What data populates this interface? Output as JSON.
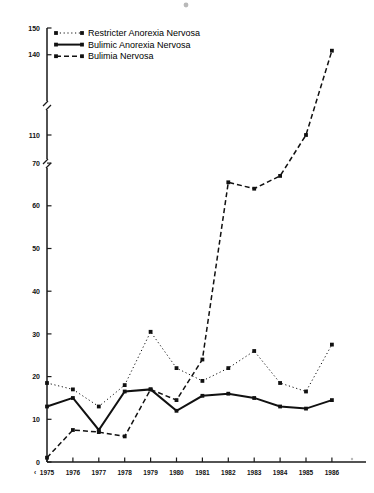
{
  "chart_data": {
    "type": "line",
    "title": "",
    "subtitle": "",
    "xlabel": "",
    "ylabel": "",
    "x": [
      1975,
      1976,
      1977,
      1978,
      1979,
      1980,
      1981,
      1982,
      1983,
      1984,
      1985,
      1986
    ],
    "categories": [
      "1975",
      "1976",
      "1977",
      "1978",
      "1979",
      "1980",
      "1981",
      "1982",
      "1983",
      "1984",
      "1985",
      "1986"
    ],
    "x_prefix_marker": "‹",
    "grid": false,
    "legend_position": "top-left",
    "ylim": [
      0,
      150
    ],
    "y_axis_broken": true,
    "y_tick_labels": [
      "0",
      "10",
      "20",
      "30",
      "40",
      "50",
      "60",
      "70",
      "110",
      "140",
      "150"
    ],
    "y_ticks": [
      0,
      10,
      20,
      30,
      40,
      50,
      60,
      70,
      110,
      140,
      150
    ],
    "y_breaks": [
      {
        "after": 70,
        "before": 110
      },
      {
        "after": 110,
        "before": 140
      }
    ],
    "series": [
      {
        "name": "Restricter Anorexia Nervosa",
        "style": "dotted",
        "marker": "square",
        "values": [
          18.5,
          17,
          13,
          18,
          30.5,
          22,
          19,
          22,
          26,
          18.5,
          16.5,
          27.5
        ]
      },
      {
        "name": "Bulimic Anorexia Nervosa",
        "style": "solid",
        "marker": "square",
        "values": [
          13,
          15,
          7.5,
          16.5,
          17,
          12,
          15.5,
          16,
          15,
          13,
          12.5,
          14.5
        ]
      },
      {
        "name": "Bulimia Nervosa",
        "style": "dashed",
        "marker": "square",
        "values": [
          1,
          7.5,
          7,
          6,
          17,
          14.5,
          24,
          65.5,
          64,
          67,
          110,
          141.5
        ]
      }
    ]
  },
  "legend": {
    "entries": [
      {
        "label": "Restricter Anorexia Nervosa",
        "style": "dotted"
      },
      {
        "label": "Bulimic Anorexia Nervosa",
        "style": "solid"
      },
      {
        "label": "Bulimia Nervosa",
        "style": "dashed"
      }
    ]
  },
  "colors": {
    "ink": "#111111",
    "axis": "#1a1a1a",
    "background": "#ffffff"
  }
}
